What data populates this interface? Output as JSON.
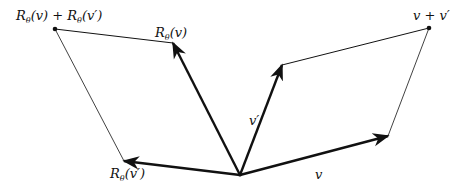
{
  "diagram": {
    "colors": {
      "stroke": "#111111",
      "background": "#ffffff"
    },
    "points": {
      "origin": [
        240,
        175
      ],
      "v": [
        388,
        136
      ],
      "v_prime": [
        282,
        65
      ],
      "v_plus_v_prime": [
        429,
        28
      ],
      "R_v": [
        173,
        43
      ],
      "R_v_prime": [
        124,
        161
      ],
      "R_sum": [
        55,
        29
      ]
    },
    "labels": {
      "v": "v",
      "v_prime": "v′",
      "v_plus_v_prime": "v + v′",
      "R_v": "Rθ(v)",
      "R_v_prime": "Rθ(v′)",
      "R_sum": "Rθ(v) + Rθ(v′)"
    }
  }
}
